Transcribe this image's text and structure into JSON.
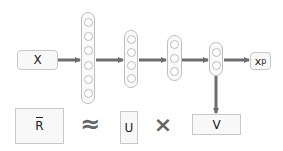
{
  "diagram": {
    "input_label": "X",
    "output_label": "x",
    "output_superscript": "p",
    "layers": [
      {
        "name": "layer-1",
        "units": 6
      },
      {
        "name": "layer-2",
        "units": 4
      },
      {
        "name": "layer-3",
        "units": 3
      },
      {
        "name": "layer-4",
        "units": 2
      }
    ],
    "equation": {
      "lhs": "R",
      "approx_symbol": "≈",
      "factor_1": "U",
      "times_symbol": "×",
      "factor_2": "V"
    },
    "colors": {
      "arrow": "#6e6e6e",
      "box_border": "#c8c8c8",
      "box_fill": "#f8f8f8"
    }
  }
}
